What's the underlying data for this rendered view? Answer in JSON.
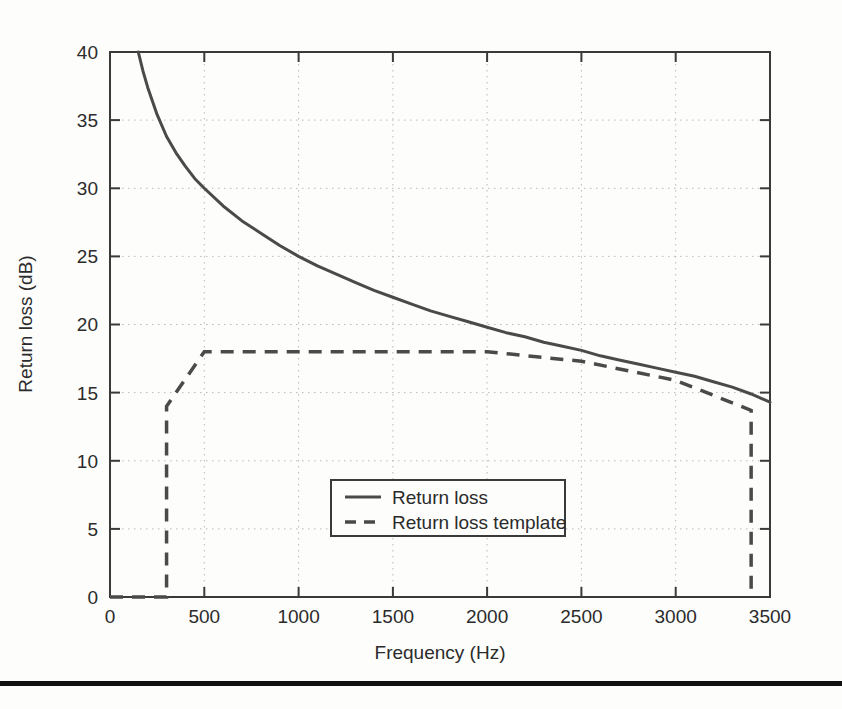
{
  "figure": {
    "background_color": "#fdfdfc",
    "line_color": "#4a4a4a",
    "axis_color": "#3a3a3a",
    "grid_color": "#b9b9b9"
  },
  "axes": {
    "x": {
      "label": "Frequency (Hz)",
      "min": 0,
      "max": 3500,
      "ticks": [
        0,
        500,
        1000,
        1500,
        2000,
        2500,
        3000,
        3500
      ],
      "tick_labels": [
        "0",
        "500",
        "1000",
        "1500",
        "2000",
        "2500",
        "3000",
        "3500"
      ]
    },
    "y": {
      "label": "Return loss (dB)",
      "min": 0,
      "max": 40,
      "ticks": [
        0,
        5,
        10,
        15,
        20,
        25,
        30,
        35,
        40
      ],
      "tick_labels": [
        "0",
        "5",
        "10",
        "15",
        "20",
        "25",
        "30",
        "35",
        "40"
      ]
    }
  },
  "legend": {
    "position": "lower-center",
    "entries": [
      {
        "label": "Return loss",
        "style": "solid"
      },
      {
        "label": "Return loss template",
        "style": "dashed"
      }
    ]
  },
  "chart_data": {
    "type": "line",
    "title": "",
    "xlabel": "Frequency (Hz)",
    "ylabel": "Return loss (dB)",
    "xlim": [
      0,
      3500
    ],
    "ylim": [
      0,
      40
    ],
    "grid": true,
    "legend_position": "lower-center",
    "series": [
      {
        "name": "Return loss",
        "style": "solid",
        "color": "#4a4a4a",
        "x": [
          150,
          175,
          200,
          250,
          300,
          350,
          400,
          450,
          500,
          600,
          700,
          800,
          900,
          1000,
          1100,
          1200,
          1300,
          1400,
          1500,
          1600,
          1700,
          1800,
          1900,
          2000,
          2100,
          2200,
          2300,
          2400,
          2500,
          2600,
          2700,
          2800,
          2900,
          3000,
          3100,
          3200,
          3300,
          3400,
          3500
        ],
        "y": [
          40.0,
          38.6,
          37.4,
          35.4,
          33.8,
          32.6,
          31.6,
          30.7,
          30.0,
          28.7,
          27.6,
          26.7,
          25.8,
          25.0,
          24.3,
          23.7,
          23.1,
          22.5,
          22.0,
          21.5,
          21.0,
          20.6,
          20.2,
          19.8,
          19.4,
          19.1,
          18.7,
          18.4,
          18.1,
          17.7,
          17.4,
          17.1,
          16.8,
          16.5,
          16.2,
          15.8,
          15.4,
          14.9,
          14.3
        ]
      },
      {
        "name": "Return loss template",
        "style": "dashed",
        "color": "#4a4a4a",
        "x": [
          0,
          300,
          300,
          500,
          2000,
          2500,
          3000,
          3400,
          3400
        ],
        "y": [
          0.0,
          0.0,
          14.0,
          18.0,
          18.0,
          17.3,
          15.9,
          13.7,
          0.0
        ]
      }
    ]
  }
}
